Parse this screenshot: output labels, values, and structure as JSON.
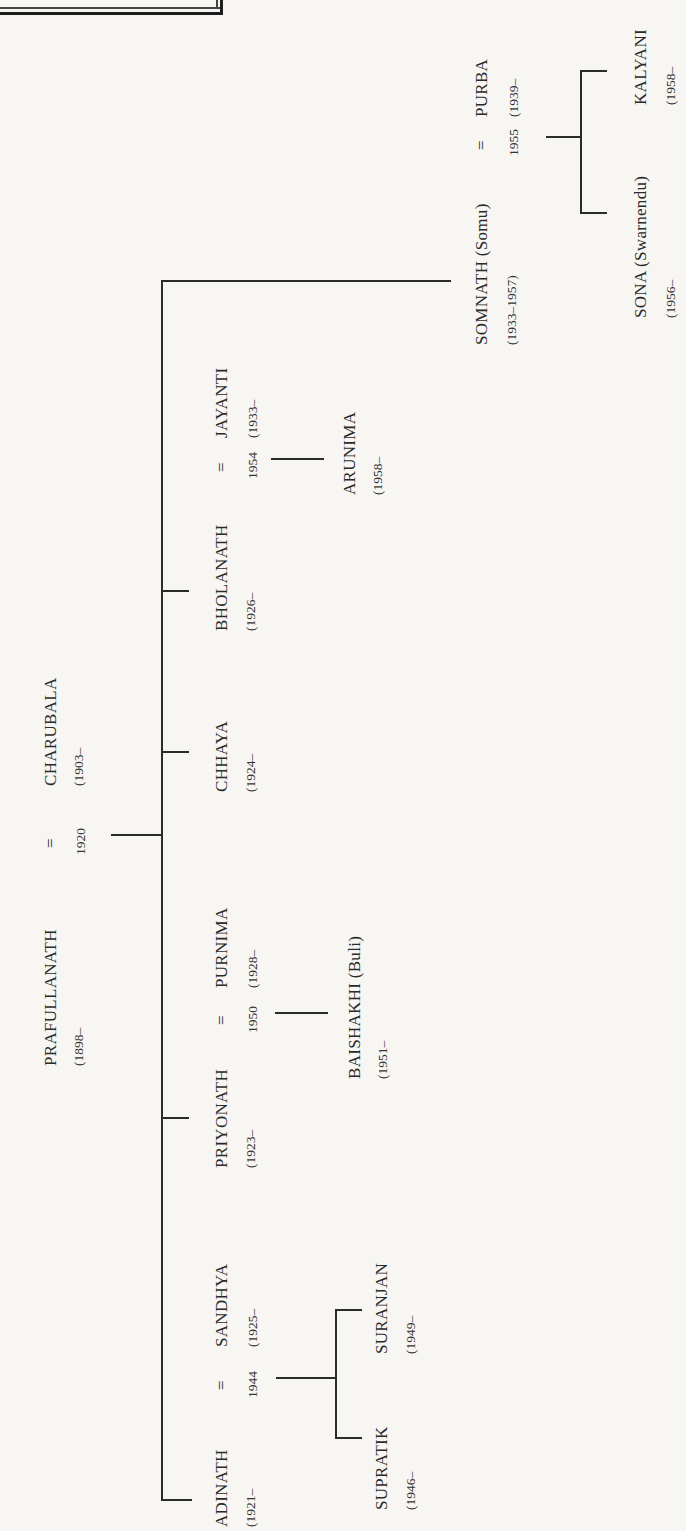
{
  "diagram": {
    "type": "family-tree",
    "orientation": "rotated-90-ccw",
    "root_couple": {
      "husband": {
        "name": "PRAFULLANATH",
        "dates": "(1898–"
      },
      "marriage_symbol": "=",
      "marriage_year": "1920",
      "wife": {
        "name": "CHARUBALA",
        "dates": "(1903–"
      }
    },
    "children": [
      {
        "name": "ADINATH",
        "dates": "(1921–",
        "spouse": {
          "name": "SANDHYA",
          "dates": "(1925–"
        },
        "marriage_symbol": "=",
        "marriage_year": "1944",
        "children": [
          {
            "name": "SUPRATIK",
            "dates": "(1946–"
          },
          {
            "name": "SURANJAN",
            "dates": "(1949–"
          }
        ]
      },
      {
        "name": "PRIYONATH",
        "dates": "(1923–",
        "spouse": {
          "name": "PURNIMA",
          "dates": "(1928–"
        },
        "marriage_symbol": "=",
        "marriage_year": "1950",
        "children": [
          {
            "name": "BAISHAKHI (Buli)",
            "dates": "(1951–"
          }
        ]
      },
      {
        "name": "CHHAYA",
        "dates": "(1924–"
      },
      {
        "name": "BHOLANATH",
        "dates": "(1926–",
        "spouse": {
          "name": "JAYANTI",
          "dates": "(1933–"
        },
        "marriage_symbol": "=",
        "marriage_year": "1954",
        "children": [
          {
            "name": "ARUNIMA",
            "dates": "(1958–"
          }
        ]
      },
      {
        "name": "SOMNATH (Somu)",
        "dates": "(1933–1957)",
        "spouse": {
          "name": "PURBA",
          "dates": "(1939–"
        },
        "marriage_symbol": "=",
        "marriage_year": "1955",
        "children": [
          {
            "name": "SONA (Swarnendu)",
            "dates": "(1956–"
          },
          {
            "name": "KALYANI",
            "dates": "(1958–"
          }
        ]
      }
    ]
  },
  "colors": {
    "paper": "#f7f6f3",
    "ink": "#2b2b2b"
  }
}
